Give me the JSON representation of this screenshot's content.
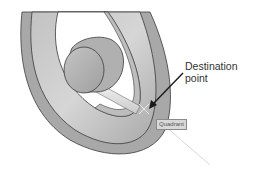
{
  "diagram": {
    "callout": {
      "line1": "Destination",
      "line2": "point"
    },
    "snap_tooltip": "Quadrant",
    "colors": {
      "background": "#ffffff",
      "ring_face": "#b8b8b8",
      "ring_face_light": "#d4d4d4",
      "ring_edge": "#a3a3a3",
      "hub": "#b3b3b3",
      "shaft": "#e2e2e2",
      "outline": "#3a3a3a",
      "arrow": "#1a1a1a",
      "tracking_line": "#d0d0d0"
    }
  }
}
